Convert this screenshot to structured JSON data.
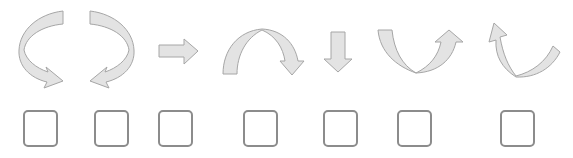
{
  "worksheet": {
    "arrows": [
      {
        "id": 1,
        "icon": "curved-arrow-counterclockwise-down-right-icon",
        "answer": ""
      },
      {
        "id": 2,
        "icon": "curved-arrow-clockwise-down-left-icon",
        "answer": ""
      },
      {
        "id": 3,
        "icon": "straight-arrow-right-icon",
        "answer": ""
      },
      {
        "id": 4,
        "icon": "arch-arrow-over-down-right-icon",
        "answer": ""
      },
      {
        "id": 5,
        "icon": "straight-arrow-down-icon",
        "answer": ""
      },
      {
        "id": 6,
        "icon": "u-arrow-down-then-up-right-icon",
        "answer": ""
      },
      {
        "id": 7,
        "icon": "u-arrow-curve-up-left-icon",
        "answer": ""
      }
    ]
  },
  "colors": {
    "arrow_fill": "#e3e3e3",
    "arrow_stroke": "#a6a6a6",
    "box_border": "#8c8c8c",
    "background": "#ffffff"
  }
}
